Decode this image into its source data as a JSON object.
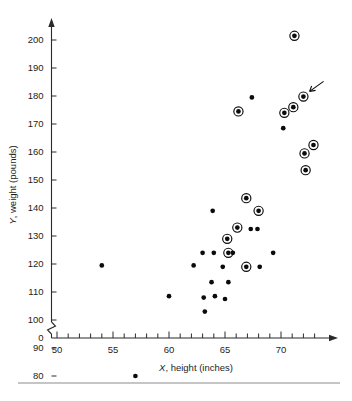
{
  "figure": {
    "bottom_rule": true,
    "pointer_annotation": {
      "name": "arrow-annotation",
      "target_x": 72.0,
      "target_y": 180,
      "description": "small arrow pointing at the circled point near (72, 180)"
    }
  },
  "chart_data": {
    "type": "scatter",
    "title": "",
    "xlabel": "X, height (inches)",
    "xlabel_italic_prefix": "X",
    "xlabel_rest": ", height (inches)",
    "ylabel": "Y, weight (pounds)",
    "ylabel_italic_prefix": "Y",
    "ylabel_rest": ", weight (pounds)",
    "xlim": [
      50,
      73.5
    ],
    "ylim": [
      75,
      207
    ],
    "grid": false,
    "legend": null,
    "axis_break": {
      "axis": "y",
      "label_below_break": "0",
      "break_between": [
        0,
        75
      ]
    },
    "xticks_major": [
      50,
      55,
      60,
      65,
      70
    ],
    "xtick_labels": [
      "50",
      "55",
      "60",
      "65",
      "70"
    ],
    "xticks_minor_step": 1,
    "yticks": [
      80,
      90,
      100,
      110,
      120,
      130,
      140,
      150,
      160,
      170,
      180,
      190,
      200
    ],
    "ytick_labels": [
      "80",
      "90",
      "100",
      "110",
      "120",
      "130",
      "140",
      "150",
      "160",
      "170",
      "180",
      "190",
      "200"
    ],
    "ytick_zero_label": "0",
    "series": [
      {
        "name": "plain points",
        "marker": "filled-circle",
        "points": [
          {
            "x": 54.0,
            "y": 119.5
          },
          {
            "x": 57.0,
            "y": 80.0
          },
          {
            "x": 60.0,
            "y": 108.5
          },
          {
            "x": 62.2,
            "y": 119.5
          },
          {
            "x": 63.0,
            "y": 124.0
          },
          {
            "x": 63.1,
            "y": 108.0
          },
          {
            "x": 63.2,
            "y": 103.0
          },
          {
            "x": 63.8,
            "y": 113.5
          },
          {
            "x": 63.9,
            "y": 139.0
          },
          {
            "x": 64.0,
            "y": 124.0
          },
          {
            "x": 64.1,
            "y": 108.5
          },
          {
            "x": 64.8,
            "y": 119.0
          },
          {
            "x": 65.0,
            "y": 107.5
          },
          {
            "x": 65.3,
            "y": 113.5
          },
          {
            "x": 65.7,
            "y": 124.0
          },
          {
            "x": 67.3,
            "y": 132.5
          },
          {
            "x": 67.9,
            "y": 132.5
          },
          {
            "x": 68.1,
            "y": 119.0
          },
          {
            "x": 67.4,
            "y": 179.5
          },
          {
            "x": 69.3,
            "y": 124.0
          },
          {
            "x": 70.2,
            "y": 168.5
          }
        ]
      },
      {
        "name": "circled points",
        "marker": "filled-circle-with-ring",
        "points": [
          {
            "x": 65.2,
            "y": 129.0
          },
          {
            "x": 65.3,
            "y": 124.0
          },
          {
            "x": 66.1,
            "y": 133.0
          },
          {
            "x": 66.2,
            "y": 174.5
          },
          {
            "x": 66.9,
            "y": 143.5
          },
          {
            "x": 66.9,
            "y": 119.0
          },
          {
            "x": 68.0,
            "y": 139.0
          },
          {
            "x": 70.3,
            "y": 174.0
          },
          {
            "x": 71.1,
            "y": 176.0
          },
          {
            "x": 71.2,
            "y": 201.5
          },
          {
            "x": 72.0,
            "y": 179.8
          },
          {
            "x": 72.1,
            "y": 159.5
          },
          {
            "x": 72.2,
            "y": 153.5
          },
          {
            "x": 72.9,
            "y": 162.5
          }
        ]
      }
    ]
  }
}
